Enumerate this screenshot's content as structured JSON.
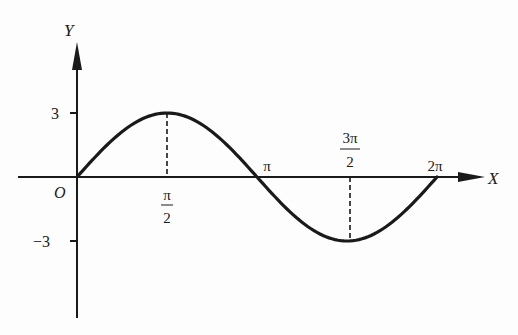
{
  "chart_data": {
    "type": "line",
    "title": "",
    "function": "y = 3 sin x",
    "xlabel": "X",
    "ylabel": "Y",
    "origin_label": "O",
    "x_ticks": [
      {
        "value": 1.5708,
        "num": "π",
        "den": "2"
      },
      {
        "value": 3.1416,
        "label": "π"
      },
      {
        "value": 4.7124,
        "num": "3π",
        "den": "2"
      },
      {
        "value": 6.2832,
        "label": "2π"
      }
    ],
    "y_ticks": [
      {
        "value": 3,
        "label": "3"
      },
      {
        "value": -3,
        "label": "−3"
      }
    ],
    "x": [
      0,
      0.7854,
      1.5708,
      2.3562,
      3.1416,
      3.927,
      4.7124,
      5.4978,
      6.2832
    ],
    "series": [
      {
        "name": "3sin(x)",
        "values": [
          0,
          2.12,
          3,
          2.12,
          0,
          -2.12,
          -3,
          -2.12,
          0
        ]
      }
    ],
    "annotations": [
      {
        "type": "dashed-vertical",
        "x": 1.5708,
        "from": 0,
        "to": 3
      },
      {
        "type": "dashed-vertical",
        "x": 4.7124,
        "from": 0,
        "to": -3
      }
    ],
    "xlim": [
      0,
      6.2832
    ],
    "ylim": [
      -3,
      3
    ],
    "grid": false,
    "legend": "none",
    "colors": {
      "ink": "#1a1a1a",
      "background": "#fdfdfd"
    }
  }
}
